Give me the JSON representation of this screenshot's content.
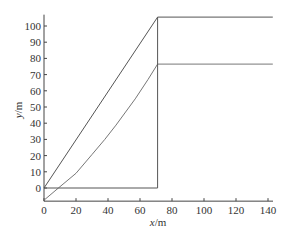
{
  "chart_data": {
    "type": "line",
    "title": "",
    "xlabel": "x/m",
    "ylabel": "y/m",
    "xlabel_italic_part": "x",
    "ylabel_italic_part": "y",
    "xlabel_unit": "/m",
    "ylabel_unit": "/m",
    "xlim": [
      0,
      145
    ],
    "ylim": [
      -7.5,
      107
    ],
    "x_ticks": [
      0,
      20,
      40,
      60,
      80,
      100,
      120,
      140
    ],
    "y_ticks": [
      0,
      10,
      20,
      30,
      40,
      50,
      60,
      70,
      80,
      90,
      100
    ],
    "grid": false,
    "legend": null,
    "series": [
      {
        "name": "upper boundary (straight line)",
        "color": "#555555",
        "points": [
          [
            0,
            0
          ],
          [
            71,
            105.5
          ],
          [
            143,
            105.5
          ]
        ]
      },
      {
        "name": "curve",
        "color": "#777777",
        "points": [
          [
            0,
            -7.5
          ],
          [
            9,
            0
          ],
          [
            20,
            9.1
          ],
          [
            30,
            20.7
          ],
          [
            38,
            30
          ],
          [
            45,
            38.8
          ],
          [
            57,
            55
          ],
          [
            65,
            67
          ],
          [
            71,
            76.5
          ],
          [
            143,
            76.5
          ]
        ]
      },
      {
        "name": "vertical boundary",
        "color": "#555555",
        "points": [
          [
            0,
            0
          ],
          [
            71,
            0
          ],
          [
            71,
            105.5
          ]
        ]
      }
    ]
  }
}
